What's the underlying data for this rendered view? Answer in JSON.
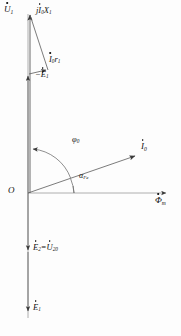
{
  "figure": {
    "type": "phasor-diagram",
    "background_color": "#fdfdfd",
    "stroke_color": "#3a3a3a",
    "text_color": "#111111",
    "width": 181,
    "height": 336
  },
  "origin": {
    "label": "O",
    "x": 28,
    "y": 193
  },
  "axes": [
    {
      "name": "flux-axis",
      "label": "Φ",
      "label_sub": "m",
      "has_dot": true,
      "direction": "horizontal-right",
      "from": [
        28,
        193
      ],
      "to": [
        168,
        193
      ],
      "label_x": 155,
      "label_y": 196
    },
    {
      "name": "emf-axis",
      "label": "E",
      "label_sub": "1",
      "direction": "vertical-down",
      "from": [
        28,
        13
      ],
      "to": [
        28,
        318
      ]
    }
  ],
  "vectors": [
    {
      "name": "u1-vector",
      "label": "U",
      "sub": "1",
      "prefix": "",
      "has_dot": true,
      "from": [
        28,
        193
      ],
      "to": [
        29,
        13
      ],
      "label_x": 7,
      "label_y": 10,
      "font_size": 9
    },
    {
      "name": "ji0x1-vector",
      "label": "jI",
      "sub": "0",
      "suffix": "X",
      "suffix_sub": "1",
      "has_dot": true,
      "from": [
        29,
        13
      ],
      "to": [
        48,
        71
      ],
      "label_x": 36,
      "label_y": 10,
      "font_size": 8.5
    },
    {
      "name": "i0r1-vector",
      "label": "I",
      "sub": "0",
      "suffix": "r",
      "suffix_sub": "1",
      "has_dot": true,
      "from": [
        28,
        74
      ],
      "to": [
        48,
        71
      ],
      "label_x": 50,
      "label_y": 58,
      "font_size": 8.5
    },
    {
      "name": "minus-e1-vector",
      "label": "−E",
      "sub": "1",
      "has_dot": true,
      "from": [
        28,
        193
      ],
      "to": [
        28,
        74
      ],
      "label_x": 37,
      "label_y": 73,
      "font_size": 8.5
    },
    {
      "name": "i0-current-vector",
      "label": "I",
      "sub": "0",
      "has_dot": true,
      "from": [
        28,
        193
      ],
      "to": [
        137,
        155
      ],
      "label_x": 140,
      "label_y": 143,
      "font_size": 9
    },
    {
      "name": "e2-u20-vector",
      "label": "E",
      "sub": "2",
      "equals": "=",
      "second_label": "U",
      "second_sub": "20",
      "has_dot": true,
      "from": [
        28,
        193
      ],
      "to": [
        28,
        252
      ],
      "label_x": 33,
      "label_y": 243,
      "font_size": 8.5
    },
    {
      "name": "e1-vector",
      "label": "E",
      "sub": "1",
      "has_dot": true,
      "from": [
        28,
        193
      ],
      "to": [
        28,
        318
      ],
      "label_x": 33,
      "label_y": 303,
      "font_size": 8.5
    }
  ],
  "angles": [
    {
      "name": "phi0-angle",
      "label": "φ",
      "sub": "0",
      "from_axis": "i0-current-vector",
      "to_axis": "minus-e1-vector",
      "radius": 45,
      "label_x": 74,
      "label_y": 139,
      "font_size": 8.5
    },
    {
      "name": "alpha-fe-angle",
      "label": "α",
      "sub": "Fe",
      "from_axis": "flux-axis",
      "to_axis": "i0-current-vector",
      "radius": 46,
      "label_x": 80,
      "label_y": 174,
      "font_size": 8
    }
  ]
}
